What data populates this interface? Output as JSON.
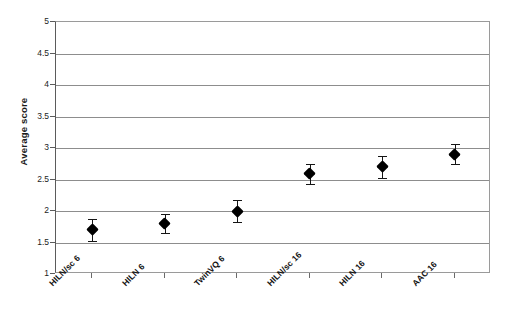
{
  "chart_data": {
    "type": "scatter",
    "title": "",
    "subtitle": "",
    "xlabel": "",
    "ylabel": "Average score",
    "categories": [
      "HILN/sc 6",
      "HILN 6",
      "TwinVQ 6",
      "HILN/sc 16",
      "HILN 16",
      "AAC 16"
    ],
    "values": [
      1.7,
      1.8,
      2.0,
      2.6,
      2.7,
      2.9
    ],
    "errors_low": [
      0.17,
      0.15,
      0.17,
      0.17,
      0.17,
      0.16
    ],
    "errors_high": [
      0.17,
      0.15,
      0.17,
      0.15,
      0.17,
      0.17
    ],
    "ylim": [
      1,
      5
    ],
    "ytick_labels": [
      "1",
      "1.5",
      "2",
      "2.5",
      "3",
      "3.5",
      "4",
      "4.5",
      "5"
    ],
    "ytick_values": [
      1,
      1.5,
      2,
      2.5,
      3,
      3.5,
      4,
      4.5,
      5
    ],
    "grid": true,
    "legend": false,
    "legend_position": "none",
    "marker": "diamond",
    "marker_color": "#000000",
    "error_bar_color": "#151515",
    "gridline_color": "#8d8d8d",
    "axis_color": "#5b5b5b",
    "background_color": "#ffffff"
  },
  "axis": {
    "y_title": "Average score"
  }
}
